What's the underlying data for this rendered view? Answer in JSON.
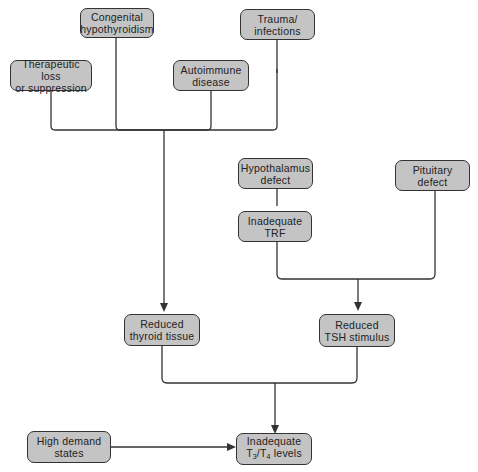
{
  "nodes": {
    "congenital": "Congenital\nhypothyroidism",
    "trauma": "Trauma/\ninfections",
    "therapeutic": "Therapeutic loss\nor suppression",
    "autoimmune": "Autoimmune\ndisease",
    "hypothalamus": "Hypothalamus\ndefect",
    "pituitary": "Pituitary\ndefect",
    "trf": "Inadequate\nTRF",
    "reduced_thyroid": "Reduced\nthyroid tissue",
    "reduced_tsh": "Reduced\nTSH stimulus",
    "high_demand": "High demand\nstates",
    "inadequate_t3t4": {
      "line1": "Inadequate",
      "t": "T",
      "sub3": "3",
      "slash": "/T",
      "sub4": "4",
      "rest": " levels"
    }
  },
  "colors": {
    "box_fill": "#c4c4c4",
    "line": "#333333"
  }
}
